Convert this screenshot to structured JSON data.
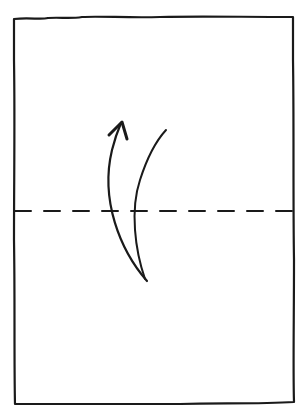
{
  "diagram": {
    "type": "origami-fold-instruction",
    "colors": {
      "background": "#ffffff",
      "ink": "#1a1a1a"
    },
    "paper": {
      "shape": "rectangle",
      "x": 14,
      "y": 18,
      "width": 280,
      "height": 386
    },
    "fold_line": {
      "style": "dashed",
      "kind": "valley-fold",
      "y": 211,
      "x_start": 14,
      "x_end": 294
    },
    "arrow": {
      "kind": "fold-over-arrow",
      "direction": "up",
      "start": [
        147,
        281
      ],
      "tip": [
        121,
        123
      ]
    }
  }
}
